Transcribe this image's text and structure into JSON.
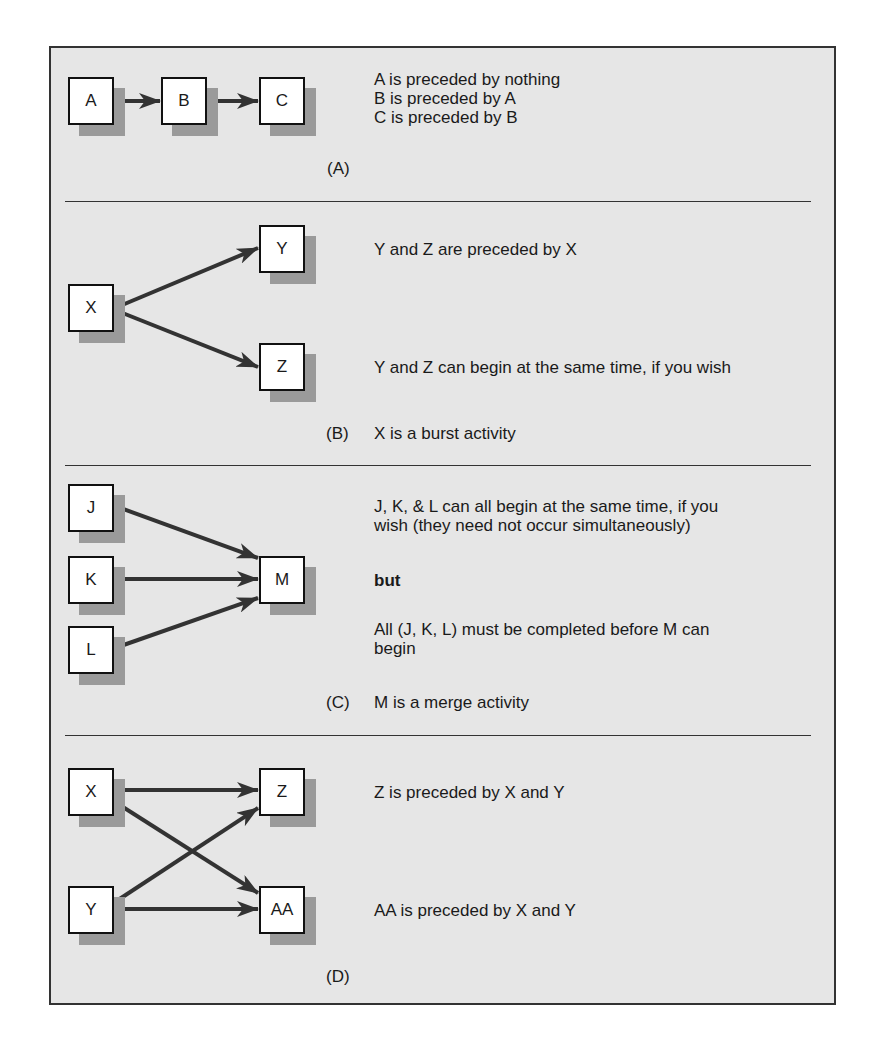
{
  "sections": [
    {
      "label": "(A)",
      "nodes": [
        {
          "id": "A",
          "label": "A",
          "x": 68,
          "y": 77
        },
        {
          "id": "B",
          "label": "B",
          "x": 161,
          "y": 77
        },
        {
          "id": "C",
          "label": "C",
          "x": 259,
          "y": 77
        }
      ],
      "edges": [
        [
          "A",
          "B"
        ],
        [
          "B",
          "C"
        ]
      ],
      "lines": [
        "A is preceded by nothing",
        "B is preceded by A",
        "C is preceded by B"
      ],
      "caption": ""
    },
    {
      "label": "(B)",
      "nodes": [
        {
          "id": "X",
          "label": "X",
          "x": 68,
          "y": 284
        },
        {
          "id": "Y",
          "label": "Y",
          "x": 259,
          "y": 225
        },
        {
          "id": "Z",
          "label": "Z",
          "x": 259,
          "y": 343
        }
      ],
      "edges": [
        [
          "X",
          "Y"
        ],
        [
          "X",
          "Z"
        ]
      ],
      "lines": [
        "Y and Z are preceded by X",
        "Y and Z can begin at the same time, if you wish"
      ],
      "caption": "X is a burst activity"
    },
    {
      "label": "(C)",
      "nodes": [
        {
          "id": "J",
          "label": "J",
          "x": 68,
          "y": 484
        },
        {
          "id": "K",
          "label": "K",
          "x": 68,
          "y": 556
        },
        {
          "id": "L",
          "label": "L",
          "x": 68,
          "y": 626
        },
        {
          "id": "M",
          "label": "M",
          "x": 259,
          "y": 556
        }
      ],
      "edges": [
        [
          "J",
          "M"
        ],
        [
          "K",
          "M"
        ],
        [
          "L",
          "M"
        ]
      ],
      "lines": [
        "J, K, & L can all begin at the same time, if you",
        "wish (they need not occur simultaneously)",
        "but",
        "All (J, K, L) must be completed before M can",
        "begin"
      ],
      "caption": "M is a merge activity"
    },
    {
      "label": "(D)",
      "nodes": [
        {
          "id": "X",
          "label": "X",
          "x": 68,
          "y": 768
        },
        {
          "id": "Y",
          "label": "Y",
          "x": 68,
          "y": 886
        },
        {
          "id": "Z",
          "label": "Z",
          "x": 259,
          "y": 768
        },
        {
          "id": "AA",
          "label": "AA",
          "x": 259,
          "y": 886
        }
      ],
      "edges": [
        [
          "X",
          "Z"
        ],
        [
          "X",
          "AA"
        ],
        [
          "Y",
          "Z"
        ],
        [
          "Y",
          "AA"
        ]
      ],
      "lines": [
        "Z is preceded by X and Y",
        "AA is preceded by X and Y"
      ],
      "caption": ""
    }
  ],
  "colors": {
    "background": "#e6e6e6",
    "border": "#333333",
    "shadow": "#9a9a9a",
    "arrow": "#333333"
  }
}
